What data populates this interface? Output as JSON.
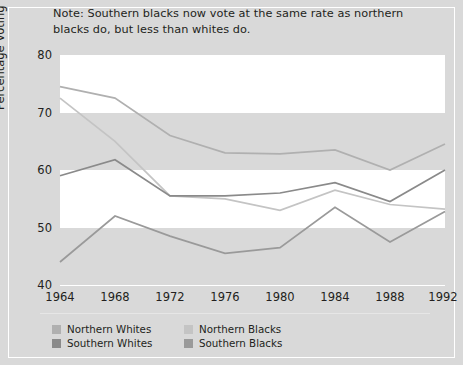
{
  "note": "Note: Southern blacks now vote at the same rate as northern blacks do, but less than whites do.",
  "axis": {
    "ylabel": "Percentage Voting",
    "yticks": [
      "80",
      "70",
      "60",
      "50",
      "40"
    ],
    "xticks": [
      "1964",
      "1968",
      "1972",
      "1976",
      "1980",
      "1984",
      "1988",
      "1992"
    ]
  },
  "legend": {
    "items": [
      {
        "label": "Northern Whites",
        "color": "#b0b0b0"
      },
      {
        "label": "Northern Blacks",
        "color": "#c4c4c4"
      },
      {
        "label": "Southern Whites",
        "color": "#8a8a8a"
      },
      {
        "label": "Southern Blacks",
        "color": "#9a9a9a"
      }
    ]
  },
  "colors": {
    "background": "#d9d9d9",
    "band": "#ffffff",
    "text": "#231f20",
    "northern_whites": "#b0b0b0",
    "northern_blacks": "#c4c4c4",
    "southern_whites": "#8a8a8a",
    "southern_blacks": "#9a9a9a"
  },
  "chart_data": {
    "type": "line",
    "title": "",
    "subtitle": "",
    "xlabel": "",
    "ylabel": "Percentage Voting",
    "x": [
      1964,
      1968,
      1972,
      1976,
      1980,
      1984,
      1988,
      1992
    ],
    "xlim": [
      1964,
      1992
    ],
    "ylim": [
      40,
      80
    ],
    "yticks": [
      40,
      50,
      60,
      70,
      80
    ],
    "grid": "horizontal-bands",
    "legend_position": "bottom-left",
    "annotations": [
      "Note: Southern blacks now vote at the same rate as northern blacks do, but less than whites do."
    ],
    "series": [
      {
        "name": "Northern Whites",
        "color": "#b0b0b0",
        "values": [
          74.5,
          72.5,
          66.0,
          63.0,
          62.8,
          63.5,
          60.0,
          64.5
        ]
      },
      {
        "name": "Northern Blacks",
        "color": "#c4c4c4",
        "values": [
          72.5,
          65.0,
          55.5,
          55.0,
          53.0,
          56.5,
          54.0,
          53.2
        ]
      },
      {
        "name": "Southern Whites",
        "color": "#8a8a8a",
        "values": [
          59.0,
          61.8,
          55.5,
          55.5,
          56.0,
          57.8,
          54.5,
          60.0
        ]
      },
      {
        "name": "Southern Blacks",
        "color": "#9a9a9a",
        "values": [
          44.0,
          52.0,
          48.5,
          45.5,
          46.5,
          53.5,
          47.5,
          52.8
        ]
      }
    ]
  }
}
